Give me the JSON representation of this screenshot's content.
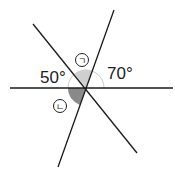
{
  "diagram": {
    "type": "intersecting-lines-angles",
    "intersection": {
      "x": 86,
      "y": 88
    },
    "lines": [
      {
        "name": "horizontal-line",
        "x1": 10,
        "y1": 88,
        "x2": 173,
        "y2": 88
      },
      {
        "name": "diagonal-nw-se-line",
        "x1": 33,
        "y1": 24,
        "x2": 137,
        "y2": 153
      },
      {
        "name": "diagonal-ne-sw-line",
        "x1": 114,
        "y1": 10,
        "x2": 58,
        "y2": 167
      }
    ],
    "angles": {
      "left_given": {
        "label": "50°",
        "value": 50
      },
      "right_given": {
        "label": "70°",
        "value": 70
      },
      "unknown_top": {
        "label": "ㄱ"
      },
      "unknown_bottom": {
        "label": "ㄴ"
      }
    },
    "colors": {
      "line": "#1a1a1a",
      "arc_light": "#cfcfcf",
      "arc_dark": "#8a8a8a",
      "arc_outline": "#bdbdbd"
    }
  }
}
